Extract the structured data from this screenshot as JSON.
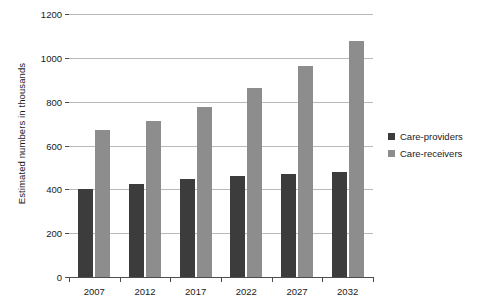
{
  "chart_data": {
    "type": "bar",
    "title": "",
    "xlabel": "",
    "ylabel": "Estimated numbers in thousands",
    "categories": [
      "2007",
      "2012",
      "2017",
      "2022",
      "2027",
      "2032"
    ],
    "series": [
      {
        "name": "Care-providers",
        "color": "#3c3c3c",
        "values": [
          400,
          425,
          448,
          463,
          470,
          480
        ]
      },
      {
        "name": "Care-receivers",
        "color": "#8d8d8d",
        "values": [
          672,
          712,
          778,
          862,
          962,
          1075
        ]
      }
    ],
    "ylim": [
      0,
      1200
    ],
    "yticks": [
      0,
      200,
      400,
      600,
      800,
      1000,
      1200
    ],
    "ytick_labels": [
      "0",
      "200",
      "400",
      "600",
      "800",
      "1000",
      "1200"
    ],
    "grid": true,
    "legend_position": "right"
  },
  "legend": {
    "entries": [
      {
        "label": "Care-providers"
      },
      {
        "label": "Care-receivers"
      }
    ]
  }
}
